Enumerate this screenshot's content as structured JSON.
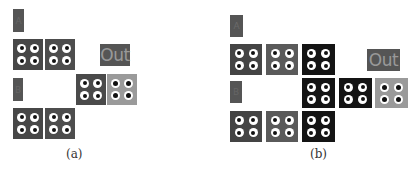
{
  "panels": [
    {
      "id": "a",
      "caption": "(a)",
      "input_labels": [
        "A",
        "B"
      ],
      "output_label": "Out",
      "blocks": [
        {
          "row": 1,
          "col": 1,
          "shade": "dark",
          "color": "#474747"
        },
        {
          "row": 1,
          "col": 2,
          "shade": "dark",
          "color": "#4d4d4d"
        },
        {
          "row": 2,
          "col": 3,
          "shade": "dark",
          "color": "#4a4a4a"
        },
        {
          "row": 2,
          "col": 4,
          "shade": "light",
          "color": "#9a9a9a"
        },
        {
          "row": 3,
          "col": 1,
          "shade": "dark",
          "color": "#474747"
        },
        {
          "row": 3,
          "col": 2,
          "shade": "dark",
          "color": "#4d4d4d"
        }
      ]
    },
    {
      "id": "b",
      "caption": "(b)",
      "input_labels": [
        "A",
        "B"
      ],
      "output_label": "Out",
      "blocks": [
        {
          "row": 1,
          "col": 1,
          "shade": "dark",
          "color": "#444444"
        },
        {
          "row": 1,
          "col": 2,
          "shade": "mid",
          "color": "#5a5a5a"
        },
        {
          "row": 1,
          "col": 3,
          "shade": "black",
          "color": "#141414"
        },
        {
          "row": 2,
          "col": 3,
          "shade": "black",
          "color": "#141414"
        },
        {
          "row": 2,
          "col": 4,
          "shade": "black",
          "color": "#141414"
        },
        {
          "row": 2,
          "col": 5,
          "shade": "light",
          "color": "#9a9a9a"
        },
        {
          "row": 3,
          "col": 1,
          "shade": "dark",
          "color": "#444444"
        },
        {
          "row": 3,
          "col": 2,
          "shade": "mid",
          "color": "#5a5a5a"
        },
        {
          "row": 3,
          "col": 3,
          "shade": "black",
          "color": "#141414"
        }
      ]
    }
  ]
}
